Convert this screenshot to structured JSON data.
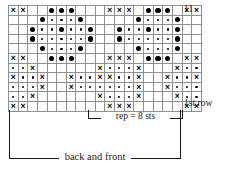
{
  "chart_data": {
    "type": "table",
    "rows": 11,
    "columns": 20,
    "row_order": "bottom-to-top",
    "legend": {
      "cross": "×",
      "dot_big": "●",
      "dot_small": "•",
      "blank": ""
    },
    "symbols_meaning": {
      "cross": "knit-stitch-symbol",
      "dot_big": "large-dot-symbol",
      "dot_small": "small-dot-symbol",
      "blank": "empty-cell"
    },
    "repeat": {
      "stitches": 8,
      "start_column": 10,
      "end_column": 17
    },
    "grid": [
      [
        "x",
        "x",
        "",
        "",
        "b",
        "b",
        "b",
        "",
        "",
        "",
        "x",
        "x",
        "x",
        "",
        "b",
        "b",
        "b",
        "",
        "x",
        "x"
      ],
      [
        "",
        "",
        "",
        "b",
        "s",
        "s",
        "s",
        "b",
        "",
        "",
        "",
        "",
        "",
        "b",
        "s",
        "s",
        "s",
        "b",
        "",
        ""
      ],
      [
        "",
        "",
        "b",
        "s",
        "s",
        "b",
        "s",
        "s",
        "b",
        "",
        "",
        "b",
        "s",
        "s",
        "b",
        "s",
        "s",
        "b",
        "",
        ""
      ],
      [
        "",
        "",
        "b",
        "s",
        "s",
        "s",
        "s",
        "s",
        "b",
        "",
        "",
        "b",
        "s",
        "s",
        "s",
        "s",
        "s",
        "b",
        "",
        ""
      ],
      [
        "",
        "",
        "",
        "b",
        "s",
        "s",
        "s",
        "b",
        "",
        "",
        "",
        "",
        "",
        "b",
        "s",
        "s",
        "s",
        "b",
        "",
        ""
      ],
      [
        "x",
        "x",
        "",
        "",
        "b",
        "b",
        "b",
        "",
        "",
        "",
        "x",
        "x",
        "x",
        "",
        "b",
        "b",
        "b",
        "",
        "x",
        "x"
      ],
      [
        "s",
        "s",
        "x",
        "",
        "",
        "",
        "",
        "",
        "",
        "x",
        "s",
        "s",
        "s",
        "x",
        "",
        "",
        "",
        "x",
        "s",
        "s"
      ],
      [
        "x",
        "s",
        "s",
        "x",
        "",
        "",
        "x",
        "s",
        "s",
        "x",
        "x",
        "s",
        "s",
        "x",
        "",
        "",
        "x",
        "s",
        "s",
        "x"
      ],
      [
        "s",
        "s",
        "s",
        "x",
        "",
        "",
        "x",
        "s",
        "s",
        "s",
        "s",
        "s",
        "s",
        "x",
        "",
        "",
        "x",
        "s",
        "s",
        "s"
      ],
      [
        "s",
        "s",
        "x",
        "",
        "",
        "",
        "",
        "",
        "",
        "x",
        "s",
        "s",
        "s",
        "x",
        "",
        "",
        "",
        "x",
        "s",
        "s"
      ],
      [
        "x",
        "x",
        "",
        "",
        "",
        "",
        "",
        "",
        "",
        "",
        "x",
        "x",
        "x",
        "",
        "",
        "",
        "",
        "",
        "x",
        "x"
      ]
    ]
  },
  "labels": {
    "top_row": "11",
    "first_row": "1st row",
    "repeat": "rep = 8 sts",
    "back_and_front": "back and front"
  }
}
